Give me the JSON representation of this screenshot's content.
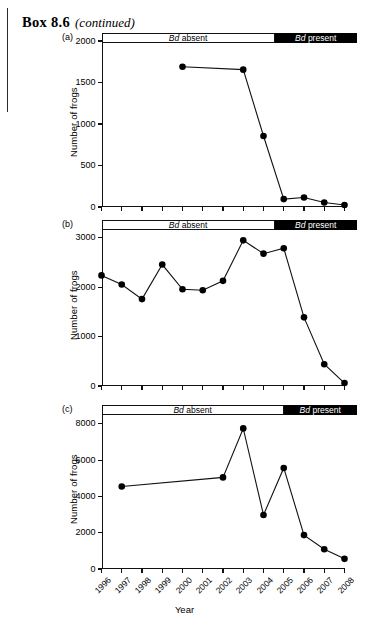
{
  "header": {
    "box_title": "Box 8.6",
    "continued": "(continued)"
  },
  "axis": {
    "ylabel": "Number of frogs",
    "xlabel": "Year",
    "year_ticks": [
      "1996",
      "1997",
      "1998",
      "1999",
      "2000",
      "2001",
      "2002",
      "2003",
      "2004",
      "2005",
      "2006",
      "2007",
      "2008"
    ]
  },
  "bands": {
    "absent_label_italic": "Bd",
    "absent_label_rest": "absent",
    "present_label_italic": "Bd",
    "present_label_rest": "present"
  },
  "panels": [
    {
      "label": "(a)"
    },
    {
      "label": "(b)"
    },
    {
      "label": "(c)"
    }
  ],
  "chart_data": [
    {
      "type": "line",
      "panel": "(a)",
      "title": "",
      "xlabel": "Year",
      "ylabel": "Number of frogs",
      "ylim": [
        0,
        2000
      ],
      "yticks": [
        0,
        500,
        1000,
        1500,
        2000
      ],
      "xlim": [
        1996,
        2008
      ],
      "x": [
        2000,
        2003,
        2004,
        2005,
        2006,
        2007,
        2008
      ],
      "values": [
        1690,
        1655,
        855,
        95,
        115,
        55,
        25
      ],
      "categories": [
        "2000",
        "2003",
        "2004",
        "2005",
        "2006",
        "2007",
        "2008"
      ],
      "grid": false,
      "legend": "none",
      "annotations": [
        {
          "text": "Bd absent",
          "x_start": 1996,
          "x_end": 2004.55
        },
        {
          "text": "Bd present",
          "x_start": 2004.55,
          "x_end": 2008.6
        }
      ]
    },
    {
      "type": "line",
      "panel": "(b)",
      "title": "",
      "xlabel": "Year",
      "ylabel": "Number of frogs",
      "ylim": [
        0,
        3200
      ],
      "yticks": [
        0,
        1000,
        2000,
        3000
      ],
      "xlim": [
        1996,
        2008
      ],
      "x": [
        1996,
        1997,
        1998,
        1999,
        2000,
        2001,
        2002,
        2003,
        2004,
        2005,
        2006,
        2007,
        2008
      ],
      "values": [
        2240,
        2055,
        1760,
        2460,
        1960,
        1940,
        2130,
        2950,
        2680,
        2790,
        1390,
        440,
        60
      ],
      "categories": [
        "1996",
        "1997",
        "1998",
        "1999",
        "2000",
        "2001",
        "2002",
        "2003",
        "2004",
        "2005",
        "2006",
        "2007",
        "2008"
      ],
      "grid": false,
      "legend": "none",
      "annotations": [
        {
          "text": "Bd absent",
          "x_start": 1996,
          "x_end": 2004.55
        },
        {
          "text": "Bd present",
          "x_start": 2004.55,
          "x_end": 2008.6
        }
      ]
    },
    {
      "type": "line",
      "panel": "(c)",
      "title": "",
      "xlabel": "Year",
      "ylabel": "Number of frogs",
      "ylim": [
        0,
        8600
      ],
      "yticks": [
        0,
        2000,
        4000,
        6000,
        8000
      ],
      "xlim": [
        1996,
        2008
      ],
      "x": [
        1997,
        2002,
        2003,
        2004,
        2005,
        2006,
        2007,
        2008
      ],
      "values": [
        4550,
        5050,
        7750,
        2980,
        5570,
        1870,
        1090,
        560
      ],
      "categories": [
        "1997",
        "2002",
        "2003",
        "2004",
        "2005",
        "2006",
        "2007",
        "2008"
      ],
      "grid": false,
      "legend": "none",
      "annotations": [
        {
          "text": "Bd absent",
          "x_start": 1996,
          "x_end": 2005.0
        },
        {
          "text": "Bd present",
          "x_start": 2005.0,
          "x_end": 2008.6
        }
      ]
    }
  ]
}
